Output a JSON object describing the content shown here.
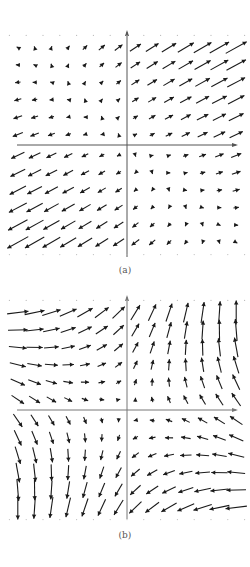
{
  "figure": {
    "panels": [
      {
        "id": "a",
        "caption": "(a)",
        "top": 28,
        "height": 235,
        "axis_x": 127,
        "axis_y": 117,
        "field": "a",
        "arrow_color": "#1a1a1a",
        "axis_color": "#555555"
      },
      {
        "id": "b",
        "caption": "(b)",
        "top": 293,
        "height": 232,
        "axis_x": 127,
        "axis_y": 117,
        "field": "b",
        "arrow_color": "#1a1a1a",
        "axis_color": "#777777"
      }
    ],
    "grid": {
      "columns_left": 7,
      "columns_right": 7,
      "rows_above": 6,
      "rows_below": 6,
      "spacing_x": 16.8,
      "spacing_y": 17.4
    }
  },
  "chart_data": [
    {
      "type": "vector_field",
      "title": "(a)",
      "description": "Vector field with large arrows pointing northeast in the upper-right quadrant and southwest in the lower-left quadrant; small arrows in the upper-left and lower-right quadrants.",
      "quadrants": {
        "upper_right": "long arrows pointing NE (up-right), growing with distance",
        "upper_left": "short arrows; near axis point NE, far left point W/SW",
        "lower_left": "long arrows pointing SW (down-left)",
        "lower_right": "short arrows; near axis point SW/S, far right point E/NE"
      },
      "axes": {
        "x_axis": true,
        "y_axis": true,
        "arrowheads": true
      }
    },
    {
      "type": "vector_field",
      "title": "(b)",
      "description": "Vector field with arrows pointing east/northeast in the upper-left, north/northwest in the upper-right, south/southeast in the lower-left, and west/southwest in the lower-right.",
      "quadrants": {
        "upper_left": "arrows pointing E to NE",
        "upper_right": "arrows pointing N to NW",
        "lower_left": "arrows pointing SE to S",
        "lower_right": "arrows pointing W to SW"
      },
      "axes": {
        "x_axis": true,
        "y_axis": true,
        "arrowheads": true
      }
    }
  ]
}
